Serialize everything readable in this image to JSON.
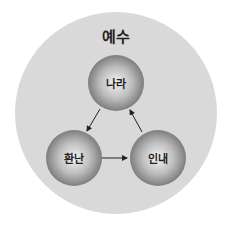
{
  "title": "예수",
  "nodes": [
    {
      "id": "top",
      "label": "나라"
    },
    {
      "id": "left",
      "label": "환난"
    },
    {
      "id": "right",
      "label": "인내"
    }
  ],
  "edges": [
    {
      "from": "나라",
      "to": "환난"
    },
    {
      "from": "환난",
      "to": "인내"
    },
    {
      "from": "인내",
      "to": "나라"
    }
  ]
}
